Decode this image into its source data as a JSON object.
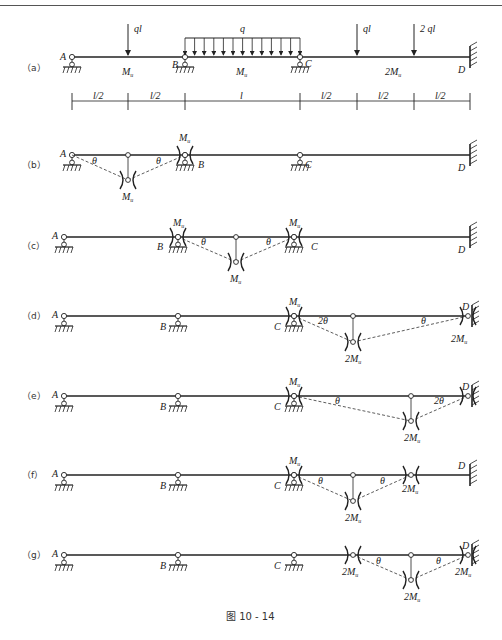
{
  "figure": {
    "caption": "图 10 - 14",
    "panels": [
      {
        "id": "a",
        "label": "（a）"
      },
      {
        "id": "b",
        "label": "（b）"
      },
      {
        "id": "c",
        "label": "（c）"
      },
      {
        "id": "d",
        "label": "（d）"
      },
      {
        "id": "e",
        "label": "（e）"
      },
      {
        "id": "f",
        "label": "（f）"
      },
      {
        "id": "g",
        "label": "（g）"
      }
    ],
    "nodes": {
      "A": "A",
      "B": "B",
      "C": "C",
      "D": "D"
    },
    "loads": {
      "p1": "ql",
      "q": "q",
      "p2": "ql",
      "p3": "2 ql"
    },
    "moments": {
      "ab": "M",
      "bc": "M",
      "cd": "2M",
      "sub": "u"
    },
    "dims": [
      "l/2",
      "l/2",
      "l",
      "l/2",
      "l/2",
      "l/2"
    ],
    "angles": {
      "theta": "θ",
      "two_theta": "2θ"
    },
    "hinge_labels": {
      "mu": "M",
      "two_mu": "2M",
      "sub": "u"
    }
  }
}
